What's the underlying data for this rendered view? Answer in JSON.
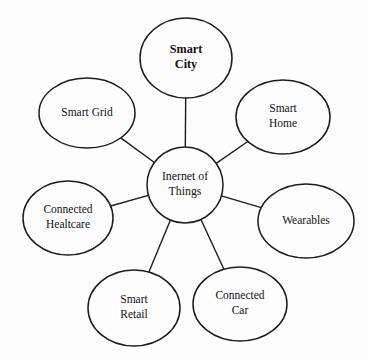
{
  "diagram": {
    "type": "hub-and-spoke",
    "background_color": "#fdfdfd",
    "stroke_color": "#1c1c1c",
    "center": {
      "id": "internet-of-things",
      "label_lines": [
        "Inernet of",
        "Things"
      ],
      "line1": "Inernet of",
      "line2": "Things",
      "cx": 185,
      "cy": 185,
      "rx": 38,
      "ry": 38,
      "bold": false
    },
    "nodes": [
      {
        "id": "smart-city",
        "line1": "Smart",
        "line2": "City",
        "cx": 186,
        "cy": 58,
        "rx": 46,
        "ry": 40,
        "bold": true
      },
      {
        "id": "smart-home",
        "line1": "Smart",
        "line2": "Home",
        "cx": 283,
        "cy": 117,
        "rx": 47,
        "ry": 37,
        "bold": false
      },
      {
        "id": "wearables",
        "line1": "Wearables",
        "line2": "",
        "cx": 306,
        "cy": 221,
        "rx": 48,
        "ry": 37,
        "bold": false
      },
      {
        "id": "connected-car",
        "line1": "Connected",
        "line2": "Car",
        "cx": 240,
        "cy": 304,
        "rx": 47,
        "ry": 37,
        "bold": false
      },
      {
        "id": "smart-retail",
        "line1": "Smart",
        "line2": "Retail",
        "cx": 134,
        "cy": 308,
        "rx": 46,
        "ry": 38,
        "bold": false
      },
      {
        "id": "connected-healtcare",
        "line1": "Connected",
        "line2": "Healtcare",
        "cx": 68,
        "cy": 218,
        "rx": 45,
        "ry": 37,
        "bold": false
      },
      {
        "id": "smart-grid",
        "line1": "Smart Grid",
        "line2": "",
        "cx": 87,
        "cy": 113,
        "rx": 48,
        "ry": 35,
        "bold": false
      }
    ]
  }
}
